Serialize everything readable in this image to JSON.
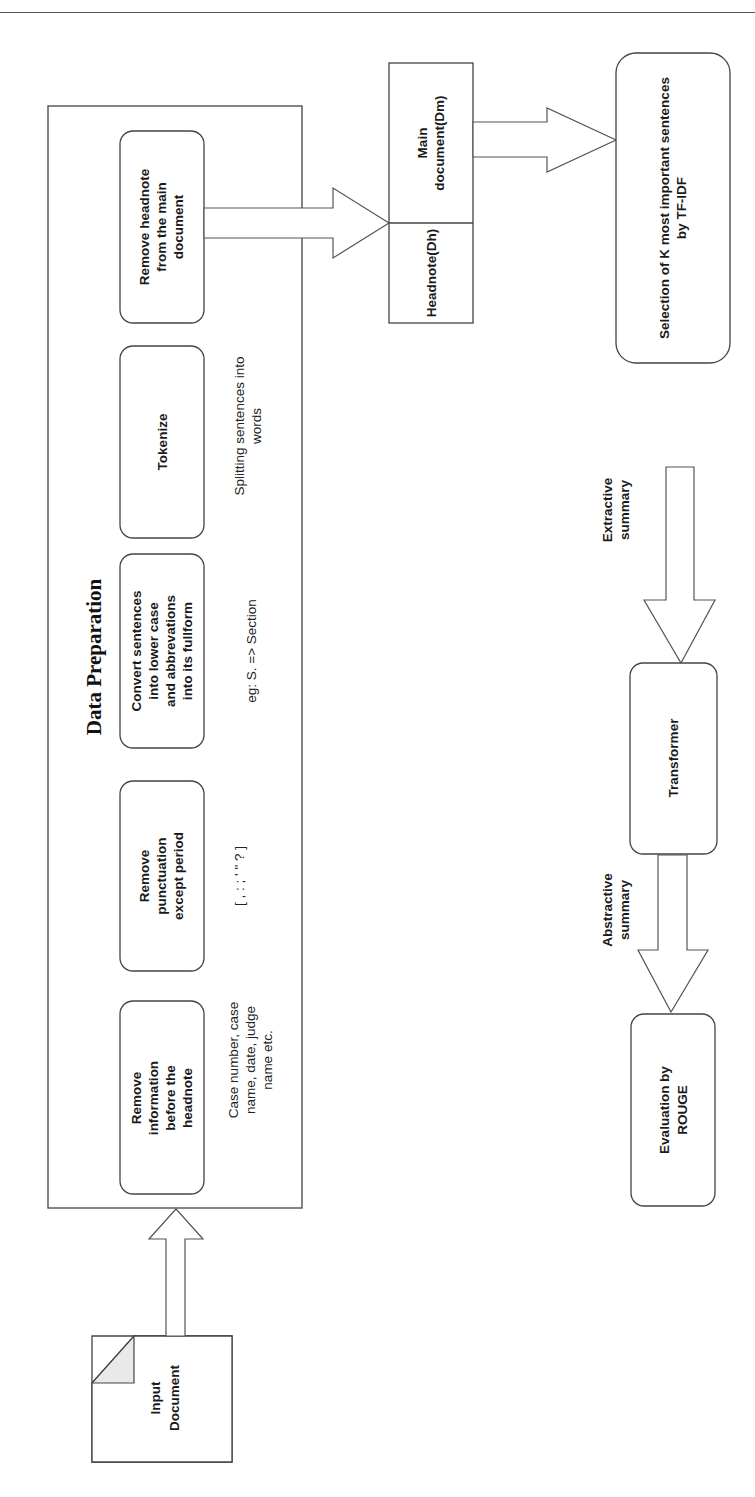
{
  "diagram": {
    "title": "Data Preparation",
    "input": {
      "label_lines": [
        "Input",
        "Document"
      ]
    },
    "steps": [
      {
        "id": "remove-info",
        "label_lines": [
          "Remove",
          "information",
          "before the",
          "headnote"
        ],
        "note_lines": [
          "Case number, case",
          "name, date, judge",
          "name etc."
        ]
      },
      {
        "id": "remove-punct",
        "label_lines": [
          "Remove",
          "punctuation",
          "except period"
        ],
        "note_lines": [
          "[ , : ; ' \" ? ]"
        ]
      },
      {
        "id": "convert-case",
        "label_lines": [
          "Convert sentences",
          "into lower case",
          "and abbrevations",
          "into its fullform"
        ],
        "note_lines": [
          "eg: S. => Section"
        ]
      },
      {
        "id": "tokenize",
        "label_lines": [
          "Tokenize"
        ],
        "note_lines": [
          "Splitting sentences into",
          "words"
        ]
      },
      {
        "id": "remove-headnote",
        "label_lines": [
          "Remove headnote",
          "from the main",
          "document"
        ],
        "note_lines": []
      }
    ],
    "split": {
      "headnote": {
        "label_lines": [
          "Headnote(Dh)"
        ]
      },
      "main_document": {
        "label_lines": [
          "Main",
          "document(Dm)"
        ]
      }
    },
    "selection": {
      "label_lines": [
        "Selection of K most important sentences",
        "by TF-IDF"
      ]
    },
    "edge_extractive": {
      "label_lines": [
        "Extractive",
        "summary"
      ]
    },
    "transformer": {
      "label_lines": [
        "Transformer"
      ]
    },
    "edge_abstractive": {
      "label_lines": [
        "Abstractive",
        "summary"
      ]
    },
    "evaluation": {
      "label_lines": [
        "Evaluation by",
        "ROUGE"
      ]
    }
  }
}
